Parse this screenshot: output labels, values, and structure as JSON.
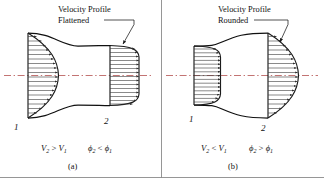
{
  "figure": {
    "divider_color": "#8a8a8a",
    "line_color": "#101010",
    "vector_color": "#3a3a3a",
    "centerline_color": "#b4504f"
  },
  "panels": [
    {
      "id": "a",
      "caption": "(a)",
      "annotation": {
        "line1": "Velocity Profile",
        "line2": "Flattened",
        "leader": "leader-line-to-station-2"
      },
      "duct_type": "converging-nozzle",
      "stations": [
        {
          "label": "1",
          "profile": "rounded",
          "position": "left"
        },
        {
          "label": "2",
          "profile": "flattened",
          "position": "right"
        }
      ],
      "relations": [
        {
          "lhs": "V",
          "lhs_sub": "2",
          "op": ">",
          "rhs": "V",
          "rhs_sub": "1"
        },
        {
          "lhs": "ϕ",
          "lhs_sub": "2",
          "op": "<",
          "rhs": "ϕ",
          "rhs_sub": "1"
        }
      ]
    },
    {
      "id": "b",
      "caption": "(b)",
      "annotation": {
        "line1": "Velocity Profile",
        "line2": "Rounded",
        "leader": "leader-line-to-station-2"
      },
      "duct_type": "diverging-diffuser",
      "stations": [
        {
          "label": "1",
          "profile": "flattened",
          "position": "left"
        },
        {
          "label": "2",
          "profile": "rounded",
          "position": "right"
        }
      ],
      "relations": [
        {
          "lhs": "V",
          "lhs_sub": "2",
          "op": "<",
          "rhs": "V",
          "rhs_sub": "1"
        },
        {
          "lhs": "ϕ",
          "lhs_sub": "2",
          "op": ">",
          "rhs": "ϕ",
          "rhs_sub": "1"
        }
      ]
    }
  ]
}
